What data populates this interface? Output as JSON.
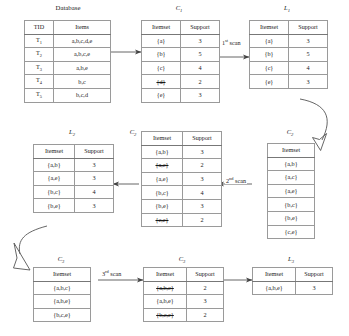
{
  "diagram": {
    "database_caption": "Database",
    "scans": [
      {
        "id": "scan1",
        "label_prefix": "1",
        "label_sup": "st",
        "label_suffix": " scan"
      },
      {
        "id": "scan2",
        "label_prefix": "2",
        "label_sup": "nd",
        "label_suffix": " scan"
      },
      {
        "id": "scan3",
        "label_prefix": "3",
        "label_sup": "rd",
        "label_suffix": " scan"
      }
    ],
    "tables": {
      "database": {
        "caption": "Database",
        "caption_base": "",
        "caption_sub": "",
        "headers": [
          "TID",
          "Items"
        ],
        "rows": [
          {
            "cells": [
              "T",
              "a,b,c,d,e"
            ],
            "sub": "1",
            "struck": false
          },
          {
            "cells": [
              "T",
              "a,b,c,e"
            ],
            "sub": "2",
            "struck": false
          },
          {
            "cells": [
              "T",
              "a,b,e"
            ],
            "sub": "3",
            "struck": false
          },
          {
            "cells": [
              "T",
              "b,c"
            ],
            "sub": "4",
            "struck": false
          },
          {
            "cells": [
              "T",
              "b,c,d"
            ],
            "sub": "5",
            "struck": false
          }
        ]
      },
      "c1": {
        "caption_base": "C",
        "caption_sub": "1",
        "headers": [
          "Itemset",
          "Support"
        ],
        "rows": [
          {
            "cells": [
              "{a}",
              "3"
            ],
            "struck": false
          },
          {
            "cells": [
              "{b}",
              "5"
            ],
            "struck": false
          },
          {
            "cells": [
              "{c}",
              "4"
            ],
            "struck": false
          },
          {
            "cells": [
              "{d}",
              "2"
            ],
            "struck": true
          },
          {
            "cells": [
              "{e}",
              "3"
            ],
            "struck": false
          }
        ]
      },
      "l1": {
        "caption_base": "L",
        "caption_sub": "1",
        "headers": [
          "Itemset",
          "Support"
        ],
        "rows": [
          {
            "cells": [
              "{a}",
              "3"
            ],
            "struck": false
          },
          {
            "cells": [
              "{b}",
              "5"
            ],
            "struck": false
          },
          {
            "cells": [
              "{c}",
              "4"
            ],
            "struck": false
          },
          {
            "cells": [
              "{e}",
              "3"
            ],
            "struck": false
          }
        ]
      },
      "c2_candidates": {
        "caption_base": "C",
        "caption_sub": "2",
        "headers": [
          "Itemset"
        ],
        "rows": [
          {
            "cells": [
              "{a,b}"
            ],
            "struck": false
          },
          {
            "cells": [
              "{a,c}"
            ],
            "struck": false
          },
          {
            "cells": [
              "{a,e}"
            ],
            "struck": false
          },
          {
            "cells": [
              "{b,c}"
            ],
            "struck": false
          },
          {
            "cells": [
              "{b,e}"
            ],
            "struck": false
          },
          {
            "cells": [
              "{c,e}"
            ],
            "struck": false
          }
        ]
      },
      "c2_counted": {
        "caption_base": "C",
        "caption_sub": "2",
        "headers": [
          "Itemset",
          "Support"
        ],
        "rows": [
          {
            "cells": [
              "{a,b}",
              "3"
            ],
            "struck": false
          },
          {
            "cells": [
              "{a,c}",
              "2"
            ],
            "struck": true
          },
          {
            "cells": [
              "{a,e}",
              "3"
            ],
            "struck": false
          },
          {
            "cells": [
              "{b,c}",
              "4"
            ],
            "struck": false
          },
          {
            "cells": [
              "{b,e}",
              "3"
            ],
            "struck": false
          },
          {
            "cells": [
              "{c,e}",
              "2"
            ],
            "struck": true
          }
        ]
      },
      "l2": {
        "caption_base": "L",
        "caption_sub": "2",
        "headers": [
          "Itemset",
          "Support"
        ],
        "rows": [
          {
            "cells": [
              "{a,b}",
              "3"
            ],
            "struck": false
          },
          {
            "cells": [
              "{a,e}",
              "3"
            ],
            "struck": false
          },
          {
            "cells": [
              "{b,c}",
              "4"
            ],
            "struck": false
          },
          {
            "cells": [
              "{b,e}",
              "3"
            ],
            "struck": false
          }
        ]
      },
      "c3_candidates": {
        "caption_base": "C",
        "caption_sub": "3",
        "headers": [
          "Itemset"
        ],
        "rows": [
          {
            "cells": [
              "{a,b,c}"
            ],
            "struck": false
          },
          {
            "cells": [
              "{a,b,e}"
            ],
            "struck": false
          },
          {
            "cells": [
              "{b,c,e}"
            ],
            "struck": false
          }
        ]
      },
      "c3_counted": {
        "caption_base": "C",
        "caption_sub": "3",
        "headers": [
          "Itemset",
          "Support"
        ],
        "rows": [
          {
            "cells": [
              "{a,b,c}",
              "2"
            ],
            "struck": true
          },
          {
            "cells": [
              "{a,b,e}",
              "3"
            ],
            "struck": false
          },
          {
            "cells": [
              "{b,c,e}",
              "2"
            ],
            "struck": true
          }
        ]
      },
      "l3": {
        "caption_base": "L",
        "caption_sub": "3",
        "headers": [
          "Itemset",
          "Support"
        ],
        "rows": [
          {
            "cells": [
              "{a,b,e}",
              "3"
            ],
            "struck": false
          }
        ]
      }
    },
    "colors": {
      "line": "#555555",
      "grid": "#9a9a9a",
      "text": "#1a1a1a",
      "background": "#ffffff"
    }
  }
}
